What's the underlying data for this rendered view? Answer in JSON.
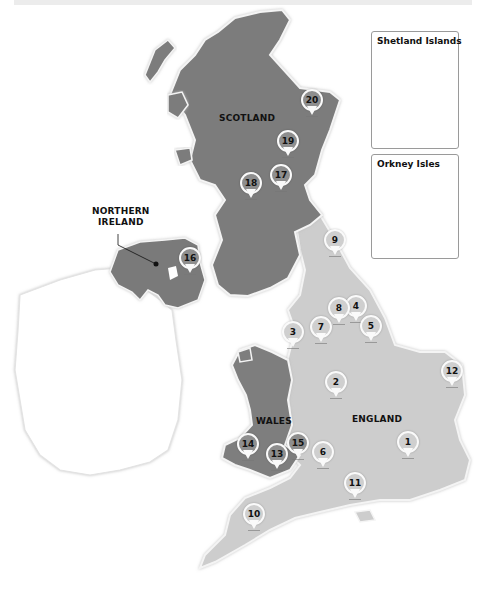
{
  "map": {
    "title": "",
    "colors": {
      "scotland": "#7c7c7c",
      "northern_ireland": "#7a7a7a",
      "wales": "#7e7e7e",
      "england": "#cdcdcd",
      "ireland": "#ffffff",
      "pin_on_dark": "#8e8e8e",
      "pin_on_light": "#cfcfcf",
      "coast_glow": "#f4f4f4"
    },
    "regions": {
      "scotland": "SCOTLAND",
      "northern_ireland_line1": "NORTHERN",
      "northern_ireland_line2": "IRELAND",
      "wales": "WALES",
      "england": "ENGLAND"
    },
    "insets": {
      "shetland": "Shetland Islands",
      "orkney": "Orkney Isles"
    },
    "pins": [
      {
        "id": "1",
        "label": "1",
        "region": "england"
      },
      {
        "id": "2",
        "label": "2",
        "region": "england"
      },
      {
        "id": "3",
        "label": "3",
        "region": "england"
      },
      {
        "id": "4",
        "label": "4",
        "region": "england"
      },
      {
        "id": "5",
        "label": "5",
        "region": "england"
      },
      {
        "id": "6",
        "label": "6",
        "region": "england"
      },
      {
        "id": "7",
        "label": "7",
        "region": "england"
      },
      {
        "id": "8",
        "label": "8",
        "region": "england"
      },
      {
        "id": "9",
        "label": "9",
        "region": "england"
      },
      {
        "id": "10",
        "label": "10",
        "region": "england"
      },
      {
        "id": "11",
        "label": "11",
        "region": "england"
      },
      {
        "id": "12",
        "label": "12",
        "region": "england"
      },
      {
        "id": "13",
        "label": "13",
        "region": "wales"
      },
      {
        "id": "14",
        "label": "14",
        "region": "wales"
      },
      {
        "id": "15",
        "label": "15",
        "region": "wales"
      },
      {
        "id": "16",
        "label": "16",
        "region": "northern_ireland"
      },
      {
        "id": "17",
        "label": "17",
        "region": "scotland"
      },
      {
        "id": "18",
        "label": "18",
        "region": "scotland"
      },
      {
        "id": "19",
        "label": "19",
        "region": "scotland"
      },
      {
        "id": "20",
        "label": "20",
        "region": "scotland"
      }
    ]
  }
}
